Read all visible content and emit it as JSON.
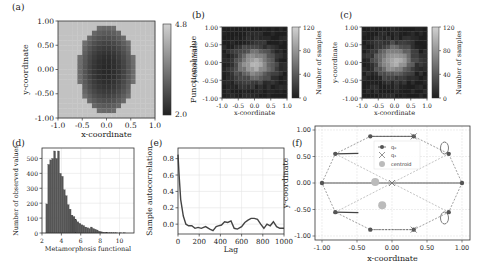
{
  "chart_data": [
    {
      "panel": "(a)",
      "type": "heatmap",
      "title": "",
      "xlabel": "x-coordinate",
      "ylabel": "y-coordinate",
      "xticks": [
        "-1.0",
        "-0.5",
        "0.0",
        "0.5",
        "1.0"
      ],
      "yticks": [
        "1.00",
        "0.50",
        "0.00",
        "-0.50",
        "-1.00"
      ],
      "xlim": [
        -1,
        1
      ],
      "ylim": [
        -1,
        1
      ],
      "colorbar": {
        "label": "Functional value",
        "ticks": [
          "4.8",
          "2.0"
        ],
        "range": [
          2.0,
          4.8
        ]
      },
      "description": "Dark ellipse-like low-value region centered near origin (x -0.6..0.55, y -0.9..0.9), high values (~4.5) elsewhere"
    },
    {
      "panel": "(b)",
      "type": "heatmap",
      "xlabel": "x-coordinate",
      "ylabel": "y-coordinate",
      "xticks": [
        "-1.0",
        "-0.5",
        "0.0",
        "0.5",
        "1.0"
      ],
      "yticks": [
        "1.00",
        "0.50",
        "0.00",
        "-0.50",
        "-1.00"
      ],
      "xlim": [
        -1,
        1
      ],
      "ylim": [
        -1,
        1
      ],
      "colorbar": {
        "label": "Number of samples",
        "ticks": [
          "120",
          "80",
          "40",
          "0"
        ],
        "range": [
          0,
          120
        ]
      },
      "description": "Sample density histogram, brightest cluster near center (~100-120 samples)"
    },
    {
      "panel": "(c)",
      "type": "heatmap",
      "xlabel": "x-coordinate",
      "ylabel": "y-coordinate",
      "xticks": [
        "-1.0",
        "-0.5",
        "0.0",
        "0.5",
        "1.0"
      ],
      "yticks": [
        "1.00",
        "0.50",
        "0.00",
        "-0.50",
        "-1.00"
      ],
      "xlim": [
        -1,
        1
      ],
      "ylim": [
        -1,
        1
      ],
      "colorbar": {
        "label": "Number of samples",
        "ticks": [
          "120",
          "80",
          "40",
          "0"
        ],
        "range": [
          0,
          120
        ]
      },
      "description": "Sample density histogram, bright cluster slightly above center"
    },
    {
      "panel": "(d)",
      "type": "bar",
      "title": "",
      "xlabel": "Metamorphosis functional",
      "ylabel": "Number of observed values",
      "xticks": [
        "2",
        "4",
        "6",
        "8",
        "10"
      ],
      "yticks": [
        "0",
        "100",
        "200",
        "300",
        "400",
        "500"
      ],
      "xlim": [
        2,
        11.5
      ],
      "ylim": [
        0,
        570
      ],
      "grid": true,
      "bins_start": 2.4,
      "bin_width": 0.2,
      "values": [
        195,
        460,
        490,
        500,
        550,
        500,
        550,
        400,
        380,
        290,
        250,
        190,
        160,
        120,
        110,
        90,
        75,
        65,
        55,
        50,
        40,
        35,
        30,
        40,
        30,
        25,
        20,
        12,
        8,
        5,
        4,
        3,
        2,
        2,
        1,
        1,
        1,
        0,
        1,
        0,
        1
      ]
    },
    {
      "panel": "(e)",
      "type": "line",
      "xlabel": "Lag",
      "ylabel": "Sample autocorrelation",
      "xticks": [
        "0",
        "200",
        "400",
        "600",
        "800",
        "1000"
      ],
      "yticks": [
        "0.0",
        "0.2",
        "0.4",
        "0.6",
        "0.8"
      ],
      "xlim": [
        0,
        1000
      ],
      "ylim": [
        -0.12,
        0.93
      ],
      "grid": true,
      "x": [
        0,
        10,
        25,
        50,
        75,
        100,
        130,
        160,
        190,
        220,
        260,
        300,
        330,
        360,
        380,
        410,
        440,
        470,
        500,
        530,
        560,
        600,
        630,
        660,
        690,
        720,
        750,
        780,
        810,
        840,
        870,
        900,
        930,
        960,
        1000
      ],
      "y": [
        0.85,
        0.6,
        0.3,
        0.1,
        0.0,
        -0.02,
        -0.02,
        -0.05,
        -0.04,
        -0.05,
        -0.03,
        -0.06,
        -0.08,
        -0.03,
        -0.02,
        -0.01,
        0.03,
        0.02,
        0.04,
        -0.05,
        -0.06,
        -0.03,
        0.02,
        0.05,
        0.07,
        0.07,
        0.06,
        0.0,
        -0.05,
        0.0,
        -0.02,
        0.03,
        -0.03,
        -0.05,
        -0.05
      ]
    },
    {
      "panel": "(f)",
      "type": "scatter",
      "xlabel": "x-coordinate",
      "ylabel": "y-coordinate",
      "xticks": [
        "-1.00",
        "-0.50",
        "0.00",
        "0.50",
        "1.00"
      ],
      "yticks": [
        "1.00",
        "0.50",
        "0.00",
        "-0.50",
        "-1.00"
      ],
      "xlim": [
        -1.05,
        1.05
      ],
      "ylim": [
        -1.05,
        1.05
      ],
      "grid": true,
      "legend": [
        "q₀",
        "q₁",
        "centroid"
      ],
      "series": [
        {
          "name": "q₀",
          "points": [
            [
              -1.0,
              0.0
            ],
            [
              -0.81,
              0.55
            ],
            [
              -0.31,
              0.88
            ],
            [
              0.31,
              0.88
            ],
            [
              0.81,
              0.55
            ],
            [
              1.0,
              0.0
            ],
            [
              0.81,
              -0.55
            ],
            [
              0.31,
              -0.88
            ],
            [
              -0.31,
              -0.88
            ],
            [
              -0.81,
              -0.55
            ]
          ]
        },
        {
          "name": "q₁",
          "points": [
            [
              0.0,
              0.0
            ],
            [
              0.31,
              -0.88
            ],
            [
              0.31,
              0.88
            ]
          ]
        },
        {
          "name": "centroid",
          "points": [
            [
              -0.24,
              0.02
            ],
            [
              -0.14,
              -0.42
            ]
          ]
        }
      ]
    }
  ],
  "labels": {
    "a": "(a)",
    "b": "(b)",
    "c": "(c)",
    "d": "(d)",
    "e": "(e)",
    "f": "(f)"
  }
}
